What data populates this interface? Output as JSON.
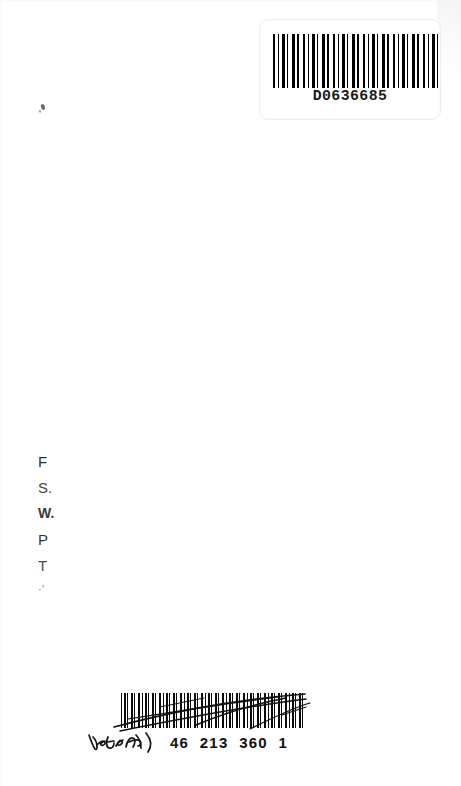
{
  "document": {
    "kind": "scanned-page",
    "description": "Blank back cover / flyleaf of a scanned book with two barcode labels, a faded library stamp and a handwritten annotation",
    "background_color": "#ffffff",
    "ink_color": "#111111",
    "width_px": 461,
    "height_px": 786
  },
  "top_label": {
    "name": "top-barcode-label",
    "barcode_value": "D0636685",
    "barcode_symbology": "code-39",
    "border_color": "#ededed"
  },
  "stamp": {
    "name": "faded-library-stamp",
    "note": "ink-faded block of left-aligned letters, partially legible",
    "lines": [
      "F",
      "S.",
      "W.",
      "P",
      "T",
      "·’"
    ]
  },
  "marks": {
    "ink_fleck": "ink-fleck",
    "pen_strikes": "diagonal-pen-strikes-over-barcode"
  },
  "bottom_label": {
    "name": "bottom-barcode-label",
    "barcode_symbology": "code-39",
    "handwriting": "handwritten-signature-scrawl",
    "printed_number": "46  213  360  1",
    "number_groups": [
      "46",
      "213",
      "360",
      "1"
    ]
  }
}
